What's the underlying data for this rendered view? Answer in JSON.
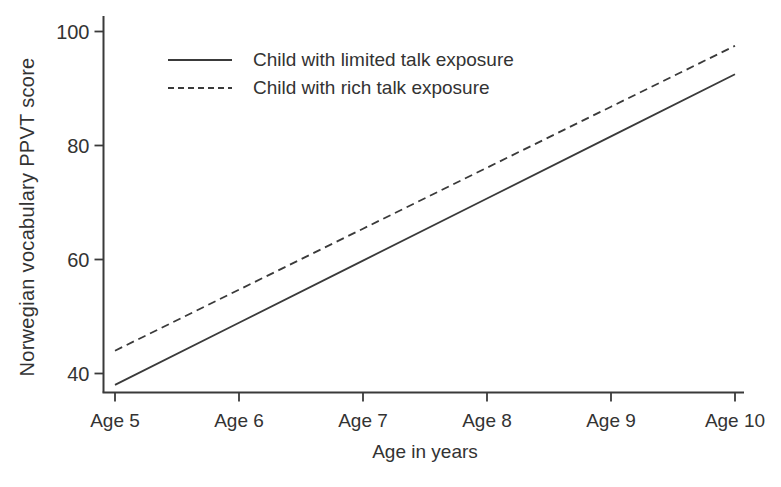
{
  "chart_data": {
    "type": "line",
    "title": "",
    "xlabel": "Age in years",
    "ylabel": "Norwegian vocabulary PPVT score",
    "x_tick_labels": [
      "Age 5",
      "Age 6",
      "Age 7",
      "Age 8",
      "Age 9",
      "Age 10"
    ],
    "x": [
      5,
      6,
      7,
      8,
      9,
      10
    ],
    "y_ticks": [
      40,
      60,
      80,
      100
    ],
    "ylim": [
      36.6,
      102.7
    ],
    "xlim": [
      5,
      10
    ],
    "grid": false,
    "legend_position": "top-left-inside",
    "series": [
      {
        "name": "Child with limited talk exposure",
        "style": "solid",
        "color": "#3a3a3a",
        "values": [
          38.0,
          48.9,
          59.8,
          70.7,
          81.6,
          92.5
        ]
      },
      {
        "name": "Child with rich talk exposure",
        "style": "dashed",
        "color": "#3a3a3a",
        "values": [
          44.0,
          54.7,
          65.4,
          76.1,
          86.8,
          97.5
        ]
      }
    ]
  },
  "colors": {
    "axis": "#3a3a3a",
    "text": "#333333",
    "background": "#ffffff"
  }
}
